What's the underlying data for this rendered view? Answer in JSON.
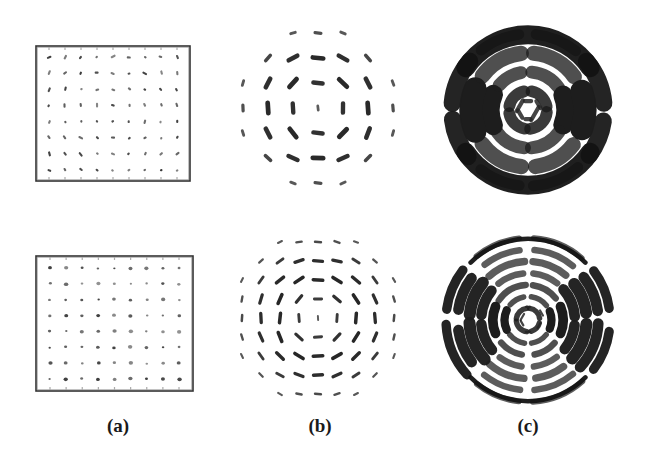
{
  "figure": {
    "background": "#ffffff",
    "ink": "#1a1a1a",
    "width": 660,
    "height": 465,
    "rows": 2,
    "columns": 3
  },
  "captions": [
    {
      "id": "caption-a",
      "label": "(a)",
      "x": 118,
      "y": 415
    },
    {
      "id": "caption-b",
      "label": "(b)",
      "x": 320,
      "y": 415
    },
    {
      "id": "caption-c",
      "label": "(c)",
      "x": 528,
      "y": 415
    }
  ],
  "panels": {
    "a_top": {
      "name": "grid-mesh-coarse",
      "type": "node-grid",
      "frame": {
        "x": 36,
        "y": 46,
        "width": 154,
        "height": 135,
        "stroke": "#333333",
        "stroke_width": 1.6
      },
      "grid": {
        "cols": 9,
        "rows": 8,
        "marker": "tick-dash",
        "marker_size": 3.1,
        "tilt_spread": 60
      },
      "inset": {
        "x": 13,
        "y": 11
      }
    },
    "a_bottom": {
      "name": "grid-mesh-fine",
      "type": "node-grid",
      "frame": {
        "x": 36,
        "y": 256,
        "width": 157,
        "height": 135,
        "stroke": "#333333",
        "stroke_width": 1.6
      },
      "grid": {
        "cols": 9,
        "rows": 8,
        "marker": "dot",
        "marker_size": 2.0,
        "tilt_spread": 20
      },
      "inset": {
        "x": 14,
        "y": 12
      }
    },
    "b_top": {
      "name": "orientation-field-coarse",
      "type": "dash-field",
      "center": {
        "x": 318,
        "y": 108
      },
      "radius": 84,
      "rings": 7,
      "spacing": 25,
      "dash_length": 13,
      "dash_width": 4.4,
      "orientation": "tangential",
      "amplitude_profile": "zero-at-center"
    },
    "b_bottom": {
      "name": "orientation-field-fine",
      "type": "dash-field",
      "center": {
        "x": 318,
        "y": 318
      },
      "radius": 88,
      "rings": 9,
      "spacing": 19,
      "dash_length": 11,
      "dash_width": 3.2,
      "orientation": "tangential",
      "amplitude_profile": "zero-at-center"
    },
    "c_top": {
      "name": "fringe-pattern-coarse",
      "type": "concentric-arcs",
      "center": {
        "x": 528,
        "y": 110
      },
      "radius": 76,
      "bands": 4,
      "band_width": 13,
      "arc_count": 4,
      "description": "thick concentric interference rings, heavy top and bottom lobes"
    },
    "c_bottom": {
      "name": "fringe-pattern-fine",
      "type": "concentric-arcs",
      "center": {
        "x": 528,
        "y": 320,
        "_": 0
      },
      "radius": 82,
      "bands": 7,
      "band_width": 7,
      "arc_count": 7,
      "description": "thin dense concentric interference rings"
    }
  }
}
